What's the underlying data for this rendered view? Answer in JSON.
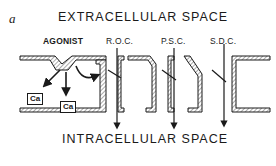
{
  "figure": {
    "panel_label": "a",
    "top_label": "EXTRACELLULAR SPACE",
    "bottom_label": "INTRACELLULAR SPACE",
    "channel_labels": {
      "agonist": "AGONIST",
      "roc": "R.O.C.",
      "psc": "P.S.C.",
      "sdc": "S.D.C."
    },
    "ions": [
      "Ca",
      "Ca"
    ]
  }
}
